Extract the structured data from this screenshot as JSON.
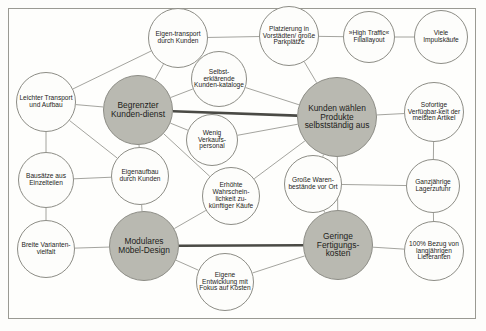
{
  "diagram": {
    "type": "activity-system-map",
    "language": "de",
    "colors": {
      "core_node_fill": "#b9b9b1",
      "satellite_node_fill": "#fdfdfb",
      "node_stroke": "#8d8d86",
      "thin_link": "#8d8d86",
      "thick_link": "#4a4a45",
      "frame_border": "#9a9a93",
      "background": "#fdfdfb",
      "text": "#1d1d1b"
    },
    "core_nodes": [
      {
        "id": "c1",
        "label": "Begrenzter Kunden-dienst",
        "cx": 138,
        "cy": 110,
        "r": 35
      },
      {
        "id": "c2",
        "label": "Kunden wählen Produkte selbstständig aus",
        "cx": 337,
        "cy": 117,
        "r": 40
      },
      {
        "id": "c3",
        "label": "Modulares Möbel-Design",
        "cx": 144,
        "cy": 246,
        "r": 35
      },
      {
        "id": "c4",
        "label": "Geringe Fertigungs-kosten",
        "cx": 338,
        "cy": 245,
        "r": 35
      }
    ],
    "satellite_nodes": [
      {
        "id": "s1",
        "label": "Eigen-transport durch Kunden",
        "cx": 178,
        "cy": 38,
        "r": 30
      },
      {
        "id": "s2",
        "label": "Selbst-erklärende Kunden-kataloge",
        "cx": 219,
        "cy": 79,
        "r": 28
      },
      {
        "id": "s3",
        "label": "Platzierung in Vorstädten/ große Parkplätze",
        "cx": 289,
        "cy": 36,
        "r": 30
      },
      {
        "id": "s4",
        "label": "»High Traffic« Filiallayout",
        "cx": 369,
        "cy": 37,
        "r": 26
      },
      {
        "id": "s5",
        "label": "Viele Impulskäufe",
        "cx": 441,
        "cy": 37,
        "r": 27
      },
      {
        "id": "s6",
        "label": "Leichter Transport und Aufbau",
        "cx": 46,
        "cy": 102,
        "r": 30
      },
      {
        "id": "s7",
        "label": "Wenig Verkaufs-personal",
        "cx": 212,
        "cy": 140,
        "r": 26
      },
      {
        "id": "s8",
        "label": "Sofortige Verfügbar-keit der meisten Artikel",
        "cx": 434,
        "cy": 112,
        "r": 30
      },
      {
        "id": "s9",
        "label": "Bausätze aus Einzelteilen",
        "cx": 46,
        "cy": 180,
        "r": 28
      },
      {
        "id": "s10",
        "label": "Eigenaufbau durch Kunden",
        "cx": 140,
        "cy": 176,
        "r": 29
      },
      {
        "id": "s11",
        "label": "Erhöhte Wahrschein-lichkeit zu-künftiger Käufe",
        "cx": 231,
        "cy": 196,
        "r": 29
      },
      {
        "id": "s12",
        "label": "Große Waren-bestände vor Ort",
        "cx": 313,
        "cy": 184,
        "r": 29
      },
      {
        "id": "s13",
        "label": "Ganzjährige Lagerzufuhr",
        "cx": 433,
        "cy": 186,
        "r": 27
      },
      {
        "id": "s14",
        "label": "Breite Varianten-vielfalt",
        "cx": 46,
        "cy": 249,
        "r": 29
      },
      {
        "id": "s15",
        "label": "100% Bezug von langjährigen Lieferanten",
        "cx": 434,
        "cy": 251,
        "r": 30
      },
      {
        "id": "s16",
        "label": "Eigene Entwicklung mit Fokus auf Kosten",
        "cx": 225,
        "cy": 282,
        "r": 29
      }
    ],
    "links": [
      {
        "from": "s1",
        "to": "c1",
        "weight": "thin"
      },
      {
        "from": "s1",
        "to": "s6",
        "weight": "thin"
      },
      {
        "from": "s1",
        "to": "s3",
        "weight": "thin"
      },
      {
        "from": "s2",
        "to": "c1",
        "weight": "thin"
      },
      {
        "from": "s2",
        "to": "c2",
        "weight": "thin"
      },
      {
        "from": "s3",
        "to": "c2",
        "weight": "thin"
      },
      {
        "from": "s3",
        "to": "s4",
        "weight": "thin"
      },
      {
        "from": "s4",
        "to": "s5",
        "weight": "thin"
      },
      {
        "from": "s6",
        "to": "c1",
        "weight": "thin"
      },
      {
        "from": "s6",
        "to": "s9",
        "weight": "thin"
      },
      {
        "from": "s6",
        "to": "s10",
        "weight": "thin"
      },
      {
        "from": "c1",
        "to": "c2",
        "weight": "thick"
      },
      {
        "from": "c1",
        "to": "s7",
        "weight": "thin"
      },
      {
        "from": "c1",
        "to": "s10",
        "weight": "thin"
      },
      {
        "from": "c1",
        "to": "s11",
        "weight": "thin"
      },
      {
        "from": "s7",
        "to": "c2",
        "weight": "thin"
      },
      {
        "from": "c2",
        "to": "s8",
        "weight": "thin"
      },
      {
        "from": "c2",
        "to": "s12",
        "weight": "thin"
      },
      {
        "from": "c2",
        "to": "s11",
        "weight": "thin"
      },
      {
        "from": "c2",
        "to": "c4",
        "weight": "thin"
      },
      {
        "from": "s8",
        "to": "s13",
        "weight": "thin"
      },
      {
        "from": "s9",
        "to": "s10",
        "weight": "thin"
      },
      {
        "from": "s9",
        "to": "s14",
        "weight": "thin"
      },
      {
        "from": "s10",
        "to": "c3",
        "weight": "thin"
      },
      {
        "from": "s11",
        "to": "c3",
        "weight": "thin"
      },
      {
        "from": "s12",
        "to": "c4",
        "weight": "thin"
      },
      {
        "from": "s12",
        "to": "s13",
        "weight": "thin"
      },
      {
        "from": "s13",
        "to": "s15",
        "weight": "thin"
      },
      {
        "from": "s14",
        "to": "c3",
        "weight": "thin"
      },
      {
        "from": "c3",
        "to": "c4",
        "weight": "thick"
      },
      {
        "from": "c3",
        "to": "s16",
        "weight": "thin"
      },
      {
        "from": "s16",
        "to": "c4",
        "weight": "thin"
      },
      {
        "from": "c4",
        "to": "s15",
        "weight": "thin"
      }
    ]
  }
}
